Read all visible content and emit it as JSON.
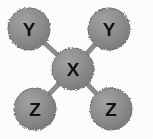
{
  "diagram": {
    "type": "molecular-structure",
    "name": "XY2Z2 central-atom bonding diagram",
    "background_color": "#fdfdfd",
    "canvas": {
      "width": 153,
      "height": 139
    },
    "style": {
      "node_fill": "#8a8a8a",
      "node_fill_light": "#9a9a9a",
      "node_edge": "#6e6e6e",
      "bond_color": "#8d8d8d",
      "bond_width": 5,
      "label_color": "#111111"
    },
    "atoms": [
      {
        "id": "atom-y-top-left",
        "label": "Y",
        "role": "substituent",
        "cx": 29,
        "cy": 29,
        "r": 21,
        "font_size": 19
      },
      {
        "id": "atom-y-top-right",
        "label": "Y",
        "role": "substituent",
        "cx": 109,
        "cy": 29,
        "r": 21,
        "font_size": 19
      },
      {
        "id": "atom-x-center",
        "label": "X",
        "role": "central",
        "cx": 73,
        "cy": 69,
        "r": 21,
        "font_size": 19
      },
      {
        "id": "atom-z-bottom-left",
        "label": "Z",
        "role": "substituent",
        "cx": 35,
        "cy": 109,
        "r": 21,
        "font_size": 19
      },
      {
        "id": "atom-z-bottom-right",
        "label": "Z",
        "role": "substituent",
        "cx": 111,
        "cy": 109,
        "r": 21,
        "font_size": 19
      }
    ],
    "bonds": [
      {
        "id": "bond-x-y-top-left",
        "from": "atom-x-center",
        "to": "atom-y-top-left",
        "x1": 73,
        "y1": 69,
        "x2": 29,
        "y2": 29
      },
      {
        "id": "bond-x-y-top-right",
        "from": "atom-x-center",
        "to": "atom-y-top-right",
        "x1": 73,
        "y1": 69,
        "x2": 109,
        "y2": 29
      },
      {
        "id": "bond-x-z-bottom-left",
        "from": "atom-x-center",
        "to": "atom-z-bottom-left",
        "x1": 73,
        "y1": 69,
        "x2": 35,
        "y2": 109
      },
      {
        "id": "bond-x-z-bottom-right",
        "from": "atom-x-center",
        "to": "atom-z-bottom-right",
        "x1": 73,
        "y1": 69,
        "x2": 111,
        "y2": 109
      }
    ]
  }
}
